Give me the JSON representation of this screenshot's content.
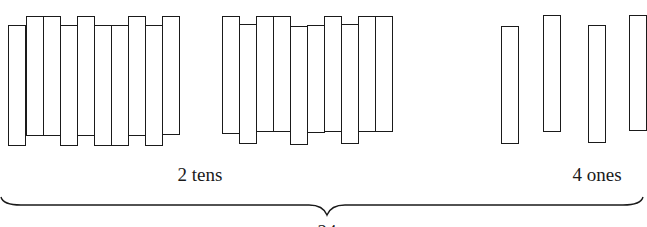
{
  "diagram": {
    "type": "place-value base-ten sticks",
    "colors": {
      "stroke": "#1a1a1a",
      "fill": "#ffffff",
      "background": "#ffffff"
    },
    "groups": [
      {
        "name": "tens-group-1",
        "sticks": [
          {
            "x": 8,
            "top": 25,
            "bottom": 146
          },
          {
            "x": 26,
            "top": 16,
            "bottom": 136
          },
          {
            "x": 43,
            "top": 16,
            "bottom": 136
          },
          {
            "x": 60,
            "top": 25,
            "bottom": 146
          },
          {
            "x": 77,
            "top": 16,
            "bottom": 136
          },
          {
            "x": 94,
            "top": 25,
            "bottom": 146
          },
          {
            "x": 111,
            "top": 25,
            "bottom": 146
          },
          {
            "x": 128,
            "top": 16,
            "bottom": 136
          },
          {
            "x": 145,
            "top": 25,
            "bottom": 146
          },
          {
            "x": 162,
            "top": 16,
            "bottom": 135
          }
        ],
        "stick_width": 18
      },
      {
        "name": "tens-group-2",
        "sticks": [
          {
            "x": 222,
            "top": 16,
            "bottom": 134
          },
          {
            "x": 239,
            "top": 24,
            "bottom": 144
          },
          {
            "x": 256,
            "top": 16,
            "bottom": 132
          },
          {
            "x": 273,
            "top": 16,
            "bottom": 132
          },
          {
            "x": 290,
            "top": 26,
            "bottom": 145
          },
          {
            "x": 307,
            "top": 25,
            "bottom": 133
          },
          {
            "x": 324,
            "top": 16,
            "bottom": 132
          },
          {
            "x": 341,
            "top": 24,
            "bottom": 144
          },
          {
            "x": 358,
            "top": 16,
            "bottom": 132
          },
          {
            "x": 375,
            "top": 16,
            "bottom": 132
          }
        ],
        "stick_width": 18
      },
      {
        "name": "ones-group",
        "sticks": [
          {
            "x": 501,
            "top": 26,
            "bottom": 144
          },
          {
            "x": 543,
            "top": 15,
            "bottom": 132
          },
          {
            "x": 588,
            "top": 25,
            "bottom": 143
          },
          {
            "x": 629,
            "top": 15,
            "bottom": 131
          }
        ],
        "stick_width": 18
      }
    ],
    "labels": {
      "tens": "2 tens",
      "ones": "4 ones",
      "total_partial": "24"
    },
    "brace": {
      "x_start": 1,
      "x_end": 643,
      "tip_x": 327,
      "y_line": 205,
      "tip_y": 215
    }
  }
}
